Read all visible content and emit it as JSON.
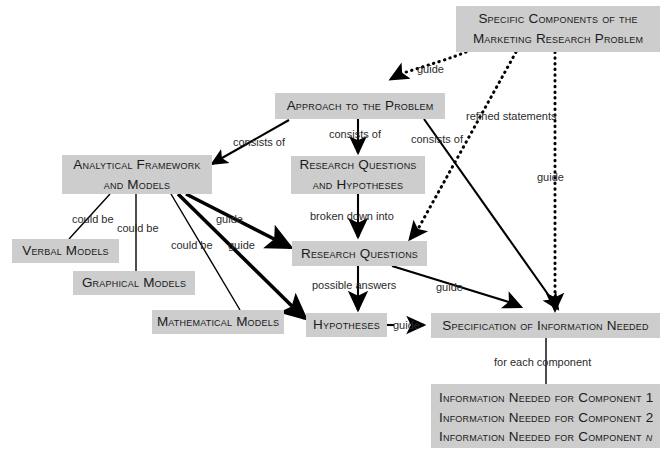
{
  "diagram": {
    "title": "Specific Components of the Marketing Research Problem",
    "background_color": "#ffffff",
    "node_fill_color": "#cdcdcd",
    "node_text_color": "#1a1a1a",
    "edge_color": "#000000"
  },
  "nodes": {
    "specific_components": {
      "line1": "Specific Components of the",
      "line2": "Marketing Research Problem"
    },
    "approach": {
      "label": "Approach to the Problem"
    },
    "analytical_framework": {
      "line1": "Analytical Framework",
      "line2": "and Models"
    },
    "research_questions_and_hypotheses": {
      "line1": "Research Questions",
      "line2": "and Hypotheses"
    },
    "verbal_models": {
      "label": "Verbal Models"
    },
    "graphical_models": {
      "label": "Graphical Models"
    },
    "mathematical_models": {
      "label": "Mathematical Models"
    },
    "research_questions": {
      "label": "Research Questions"
    },
    "hypotheses": {
      "label": "Hypotheses"
    },
    "specification": {
      "label": "Specification of Information Needed"
    },
    "components_list": {
      "line1": "Information Needed for Component 1",
      "line2": "Information Needed for Component 2",
      "line3a": "Information Needed for Component ",
      "line3b": "n"
    }
  },
  "edge_labels": {
    "guide_top": "guide",
    "refined_statements_l1": "refined",
    "refined_statements_l2": "statements",
    "guide_right_vertical": "guide",
    "consists_of_1": "consists of",
    "consists_of_2": "consists of",
    "consists_of_3": "consists of",
    "could_be_1": "could be",
    "could_be_2": "could be",
    "could_be_3": "could be",
    "guide_framework_to_rq": "guide",
    "guide_framework_to_hyp": "guide",
    "broken_down_into": "broken down into",
    "possible_answers": "possible answers",
    "guide_rq_to_spec": "guide",
    "guide_hyp_to_spec": "guide",
    "for_each_component": "for each component"
  }
}
